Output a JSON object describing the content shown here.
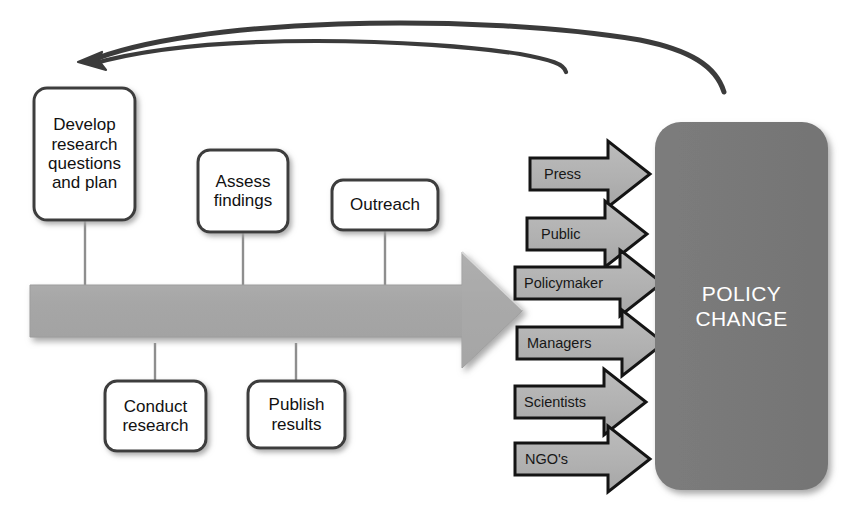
{
  "diagram": {
    "colors": {
      "background": "#ffffff",
      "box_fill": "#ffffff",
      "box_stroke": "#3a3a3a",
      "box_shadow": "#bdbdbd",
      "big_arrow_fill": "#a8a8a8",
      "big_arrow_stroke": "#9a9a9a",
      "channel_arrow_fill": "#b0b0b0",
      "channel_arrow_stroke": "#1a1a1a",
      "outcome_fill": "#7a7a7a",
      "outcome_text": "#ffffff",
      "curve_stroke": "#3b3b3b",
      "connector_stroke": "#8c8c8c"
    },
    "process_arrow": {
      "name": "main-process-arrow",
      "direction": "right"
    },
    "feedback_arrows": [
      {
        "name": "feedback-loop-long",
        "from": "policy-change",
        "to": "develop-research-questions-and-plan",
        "has_head": true
      },
      {
        "name": "feedback-loop-short",
        "from": "outreach-channels",
        "to": "develop-research-questions-and-plan",
        "has_head": false
      }
    ],
    "stages_above": [
      {
        "id": "develop",
        "label": "Develop\nresearch\nquestions\nand plan"
      },
      {
        "id": "assess",
        "label": "Assess\nfindings"
      },
      {
        "id": "outreach",
        "label": "Outreach"
      }
    ],
    "stages_below": [
      {
        "id": "conduct",
        "label": "Conduct\nresearch"
      },
      {
        "id": "publish",
        "label": "Publish\nresults"
      }
    ],
    "channels": [
      {
        "id": "press",
        "label": "Press"
      },
      {
        "id": "public",
        "label": "Public"
      },
      {
        "id": "policymaker",
        "label": "Policymaker"
      },
      {
        "id": "managers",
        "label": "Managers"
      },
      {
        "id": "scientists",
        "label": "Scientists"
      },
      {
        "id": "ngos",
        "label": "NGO's"
      }
    ],
    "outcome": {
      "id": "policy-change",
      "label": "POLICY\nCHANGE"
    }
  }
}
